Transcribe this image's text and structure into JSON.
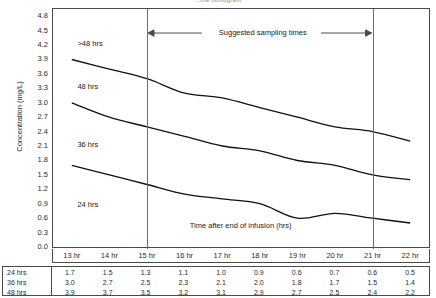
{
  "title": "...the nomogram",
  "axes": {
    "ylabel": "Concentration (mg/L)",
    "xlabel": "Time after end of infusion (hrs)",
    "yticks": [
      "4.8",
      "4.5",
      "4.2",
      "3.9",
      "3.6",
      "3.3",
      "3.0",
      "2.7",
      "2.4",
      "2.1",
      "1.8",
      "1.5",
      "1.2",
      "0.9",
      "0.6",
      "0.3",
      "0.0"
    ]
  },
  "annotation": {
    "sampling_label": "Suggested sampling times",
    "left_marker_hr": 15,
    "right_marker_hr": 21
  },
  "curve_labels": {
    "over48": ">48 hrs",
    "h48": "48 hrs",
    "h36": "36 hrs",
    "h24": "24 hrs"
  },
  "table": {
    "corner": "",
    "columns": [
      "13 hr",
      "14 hr",
      "15 hr",
      "16 hr",
      "17 hr",
      "18 hr",
      "19 hr",
      "20 hr",
      "21 hr",
      "22 hr"
    ],
    "rows": [
      {
        "label": "24 hrs",
        "values": [
          "1.7",
          "1.5",
          "1.3",
          "1.1",
          "1.0",
          "0.9",
          "0.6",
          "0.7",
          "0.6",
          "0.5"
        ]
      },
      {
        "label": "36 hrs",
        "values": [
          "3.0",
          "2.7",
          "2.5",
          "2.3",
          "2.1",
          "2.0",
          "1.8",
          "1.7",
          "1.5",
          "1.4"
        ]
      },
      {
        "label": "48 hrs",
        "values": [
          "3.9",
          "3.7",
          "3.5",
          "3.2",
          "3.1",
          "2.9",
          "2.7",
          "2.5",
          "2.4",
          "2.2"
        ]
      }
    ]
  },
  "chart_data": {
    "type": "line",
    "title": "...the nomogram",
    "xlabel": "Time after end of infusion (hrs)",
    "ylabel": "Concentration (mg/L)",
    "xlim": [
      12.5,
      22.5
    ],
    "ylim": [
      0.0,
      4.95
    ],
    "ytick_step": 0.3,
    "grid": false,
    "legend": "inline-curve-labels",
    "x": [
      13,
      14,
      15,
      16,
      17,
      18,
      19,
      20,
      21,
      22
    ],
    "series": [
      {
        "name": ">48 hrs",
        "values": [
          3.9,
          3.7,
          3.5,
          3.2,
          3.1,
          2.9,
          2.7,
          2.5,
          2.4,
          2.2
        ]
      },
      {
        "name": "36 hrs",
        "values": [
          3.0,
          2.7,
          2.5,
          2.3,
          2.1,
          2.0,
          1.8,
          1.7,
          1.5,
          1.4
        ]
      },
      {
        "name": "24 hrs",
        "values": [
          1.7,
          1.5,
          1.3,
          1.1,
          1.0,
          0.9,
          0.6,
          0.7,
          0.6,
          0.5
        ]
      }
    ],
    "annotations": [
      {
        "text": "Suggested sampling times",
        "type": "double-arrow-span",
        "x_start": 15,
        "x_end": 21
      },
      {
        "text": ">48 hrs",
        "type": "curve-label",
        "x": 13.3,
        "y": 4.25
      },
      {
        "text": "48 hrs",
        "type": "curve-label",
        "x": 13.3,
        "y": 3.35
      },
      {
        "text": "36 hrs",
        "type": "curve-label",
        "x": 13.3,
        "y": 2.15
      },
      {
        "text": "24 hrs",
        "type": "curve-label",
        "x": 13.3,
        "y": 0.9
      }
    ]
  }
}
